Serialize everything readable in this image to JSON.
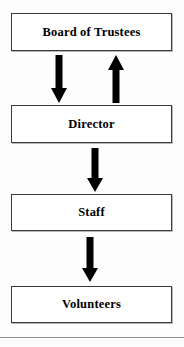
{
  "diagram": {
    "type": "organizational-flowchart",
    "orientation": "vertical",
    "background_color": "#fdfdfd",
    "box_fill_color": "#ffffff",
    "box_border_color": "#3a3a3a",
    "arrow_color": "#000000",
    "rule_color": "#8e8e8e",
    "nodes": [
      {
        "id": "board",
        "label": "Board of Trustees"
      },
      {
        "id": "director",
        "label": "Director"
      },
      {
        "id": "staff",
        "label": "Staff"
      },
      {
        "id": "volunteers",
        "label": "Volunteers"
      }
    ],
    "connectors": [
      {
        "id": "board-to-director",
        "direction": "down",
        "from": "Board of Trustees",
        "to": "Director"
      },
      {
        "id": "director-to-board",
        "direction": "up",
        "from": "Director",
        "to": "Board of Trustees"
      },
      {
        "id": "director-to-staff",
        "direction": "down",
        "from": "Director",
        "to": "Staff"
      },
      {
        "id": "staff-to-volunteers",
        "direction": "down",
        "from": "Staff",
        "to": "Volunteers"
      }
    ]
  }
}
